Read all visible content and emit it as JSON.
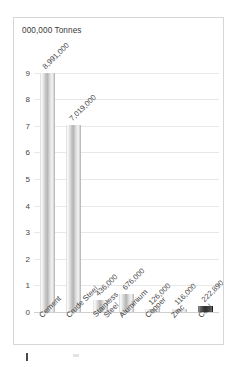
{
  "chart_data": {
    "type": "bar",
    "title": "000,000 Tonnes",
    "xlabel": "",
    "ylabel": "",
    "ylim": [
      0,
      9.4
    ],
    "yticks": [
      "0",
      "1",
      "2",
      "3",
      "4",
      "5",
      "6",
      "7",
      "8",
      "9"
    ],
    "grid": true,
    "legend": "none",
    "units_note": "Values shown in tonnes; axis in millions of tonnes",
    "categories": [
      "Cement",
      "Crude Steel",
      "Stainless Steel",
      "Aluminium",
      "Copper",
      "Zinc",
      "Coal"
    ],
    "values": [
      8.991,
      7.019,
      0.436,
      0.676,
      0.126,
      0.116,
      0.22289
    ],
    "data_labels": [
      "8,991,000",
      "7,019,000",
      "436,000",
      "676,000",
      "126,000",
      "116,000",
      "222,890"
    ],
    "colors": {
      "bar_light": "#c9c9c9",
      "bar_dark": "#2c2c2c",
      "gridline": "#e8e8e8",
      "baseline": "#cfcfcf",
      "frame_border": "#d6d6d6",
      "text": "#3f3f3f",
      "plot_background": "#ffffff"
    },
    "dark_bar_category": "Coal"
  }
}
